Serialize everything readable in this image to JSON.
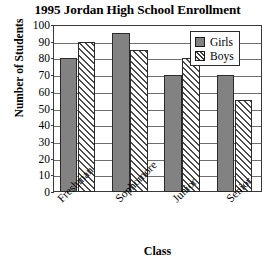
{
  "chart_data": {
    "type": "bar",
    "title": "1995 Jordan High School Enrollment",
    "xlabel": "Class",
    "ylabel": "Number of Students",
    "categories": [
      "Freshman",
      "Sophomore",
      "Junior",
      "Senior"
    ],
    "series": [
      {
        "name": "Girls",
        "values": [
          80,
          95,
          70,
          70
        ],
        "color": "#828282",
        "fill": "solid"
      },
      {
        "name": "Boys",
        "values": [
          90,
          85,
          80,
          55
        ],
        "color": "#ffffff",
        "fill": "diagonal-hatch"
      }
    ],
    "ylim": [
      0,
      100
    ],
    "yticks": [
      100,
      90,
      80,
      70,
      60,
      50,
      40,
      30,
      20,
      10,
      0
    ],
    "grid": true,
    "legend_position": "top-right",
    "legend_entries": [
      "Girls",
      "Boys"
    ]
  },
  "legend": {
    "items": [
      {
        "label": "Girls",
        "swatch": "solid-gray-swatch"
      },
      {
        "label": "Boys",
        "swatch": "hatched-swatch"
      }
    ]
  }
}
